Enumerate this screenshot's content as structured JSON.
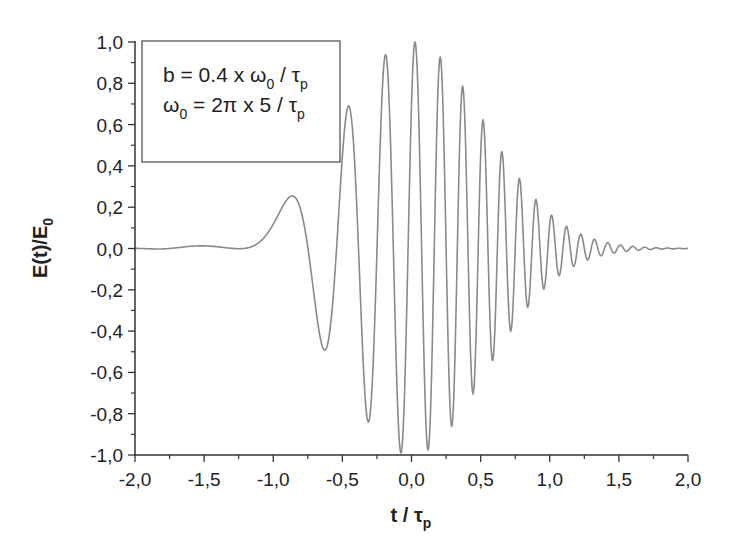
{
  "chart_data": {
    "type": "line",
    "title": "",
    "xlabel": "t / τp",
    "xlabel_main": "t / τ",
    "xlabel_sub": "p",
    "ylabel": "E(t)/E0",
    "ylabel_main": "E(t)/E",
    "ylabel_sub": "0",
    "xlim": [
      -2.0,
      2.0
    ],
    "ylim": [
      -1.0,
      1.0
    ],
    "x_ticks": [
      "-2,0",
      "-1,5",
      "-1,0",
      "-0,5",
      "0,0",
      "0,5",
      "1,0",
      "1,5",
      "2,0"
    ],
    "x_tick_values": [
      -2.0,
      -1.5,
      -1.0,
      -0.5,
      0.0,
      0.5,
      1.0,
      1.5,
      2.0
    ],
    "y_ticks": [
      "1,0",
      "0,8",
      "0,6",
      "0,4",
      "0,2",
      "0,0",
      "-0,2",
      "-0,4",
      "-0,6",
      "-0,8",
      "-1,0"
    ],
    "y_tick_values": [
      1.0,
      0.8,
      0.6,
      0.4,
      0.2,
      0.0,
      -0.2,
      -0.4,
      -0.6,
      -0.8,
      -1.0
    ],
    "grid": false,
    "legend_position": "upper-left",
    "annotation": {
      "line1": {
        "parts": [
          "b = 0.4 x ω",
          "0",
          " / τ",
          "p"
        ]
      },
      "line2": {
        "parts": [
          "ω",
          "0",
          " = 2π x 5 / τ",
          "p"
        ]
      },
      "text": [
        "b = 0.4 x ω0 / τp",
        "ω0 = 2π x 5 / τp"
      ]
    },
    "series": [
      {
        "name": "chirped pulse E(t)/E0",
        "model": {
          "description": "Linearly chirped Gaussian pulse",
          "envelope_width": 0.75,
          "omega0": 31.416,
          "chirp_b": 12.566,
          "phase_offset": -0.8
        },
        "key_points": [
          {
            "t": -2.0,
            "y": 0.0
          },
          {
            "t": -1.6,
            "y": 0.01
          },
          {
            "t": -1.1,
            "y": -0.05
          },
          {
            "t": -0.81,
            "y": 0.28
          },
          {
            "t": -0.6,
            "y": -0.52
          },
          {
            "t": -0.44,
            "y": 0.72
          },
          {
            "t": -0.29,
            "y": -0.86
          },
          {
            "t": -0.16,
            "y": 0.95
          },
          {
            "t": -0.04,
            "y": -1.0
          },
          {
            "t": 0.03,
            "y": 0.99
          },
          {
            "t": 0.14,
            "y": -0.96
          },
          {
            "t": 0.25,
            "y": 0.9
          },
          {
            "t": 0.35,
            "y": -0.8
          },
          {
            "t": 0.45,
            "y": 0.7
          },
          {
            "t": 0.55,
            "y": -0.6
          },
          {
            "t": 0.64,
            "y": 0.42
          },
          {
            "t": 0.73,
            "y": -0.42
          },
          {
            "t": 0.81,
            "y": 0.3
          },
          {
            "t": 0.9,
            "y": 0.2
          },
          {
            "t": 1.0,
            "y": 0.13
          },
          {
            "t": 1.2,
            "y": 0.05
          },
          {
            "t": 1.5,
            "y": 0.01
          },
          {
            "t": 2.0,
            "y": 0.0
          }
        ],
        "color": "#8a8a8a"
      }
    ]
  },
  "colors": {
    "axis": "#333333",
    "curve": "#8a8a8a",
    "background": "#ffffff"
  }
}
